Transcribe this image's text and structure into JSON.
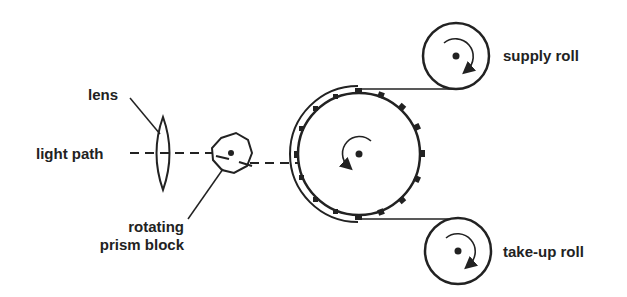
{
  "diagram": {
    "type": "film projector / scanner schematic",
    "labels": {
      "lens": "lens",
      "light_path": "light path",
      "prism_line1": "rotating",
      "prism_line2": "prism block",
      "supply_roll": "supply roll",
      "takeup_roll": "take-up roll"
    },
    "components": [
      "lens",
      "light path",
      "rotating prism block",
      "sprocket drum",
      "supply roll",
      "take-up roll"
    ],
    "colors": {
      "ink": "#222222",
      "background": "#ffffff"
    }
  }
}
